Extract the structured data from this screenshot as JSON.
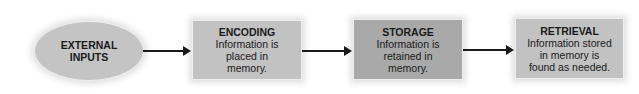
{
  "diagram": {
    "type": "flowchart",
    "nodes": [
      {
        "id": "external_inputs",
        "shape": "ellipse",
        "title": "EXTERNAL",
        "title2": "INPUTS",
        "fill": "#c4c4c4"
      },
      {
        "id": "encoding",
        "shape": "rect",
        "title": "ENCODING",
        "line1": "Information is",
        "line2": "placed in",
        "line3": "memory.",
        "fill": "#c2c2c2"
      },
      {
        "id": "storage",
        "shape": "rect",
        "title": "STORAGE",
        "line1": "Information is",
        "line2": "retained in",
        "line3": "memory.",
        "fill": "#a9a9a9"
      },
      {
        "id": "retrieval",
        "shape": "rect",
        "title": "RETRIEVAL",
        "line1": "Information stored",
        "line2": "in memory is",
        "line3": "found as needed.",
        "fill": "#c2c2c2"
      }
    ],
    "edges": [
      {
        "from": "external_inputs",
        "to": "encoding"
      },
      {
        "from": "encoding",
        "to": "storage"
      },
      {
        "from": "storage",
        "to": "retrieval"
      }
    ]
  }
}
